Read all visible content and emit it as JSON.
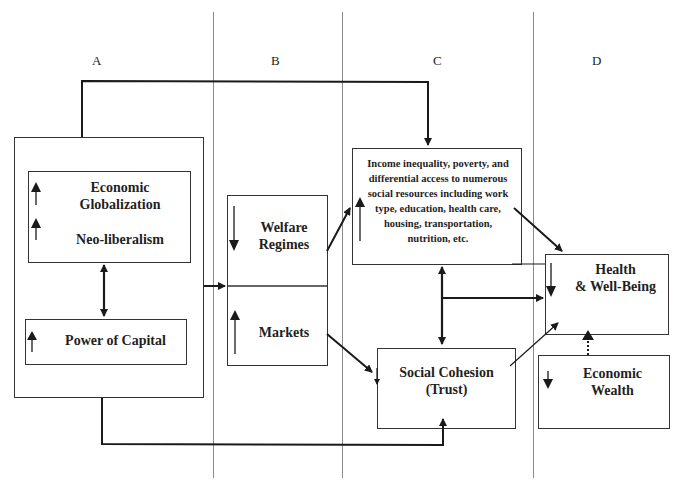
{
  "title_cropped": "",
  "columns": [
    {
      "id": "A",
      "label": "A"
    },
    {
      "id": "B",
      "label": "B"
    },
    {
      "id": "C",
      "label": "C"
    },
    {
      "id": "D",
      "label": "D"
    }
  ],
  "nodes": {
    "economic_globalization": {
      "label_line1": "Economic",
      "label_line2": "Globalization",
      "trend": "up"
    },
    "neo_liberalism": {
      "label": "Neo-liberalism",
      "trend": "up"
    },
    "power_of_capital": {
      "label": "Power of Capital",
      "trend": "up"
    },
    "welfare_regimes": {
      "label_line1": "Welfare",
      "label_line2": "Regimes",
      "trend": "down"
    },
    "markets": {
      "label": "Markets",
      "trend": "up"
    },
    "income_inequality": {
      "lines": [
        "Income inequality, poverty, and",
        "differential access to numerous",
        "social resources including work",
        "type, education, health care,",
        "housing, transportation,",
        "nutrition, etc."
      ],
      "trend": "up"
    },
    "social_cohesion": {
      "label_line1": "Social Cohesion",
      "label_line2": "(Trust)"
    },
    "health_well_being": {
      "label_line1": "Health",
      "label_line2": "& Well-Being",
      "trend": "down"
    },
    "economic_wealth": {
      "label_line1": "Economic",
      "label_line2": "Wealth",
      "trend": "down"
    }
  },
  "edges": [
    {
      "from": "column_A_box",
      "to": "income_inequality",
      "style": "solid",
      "route": "top"
    },
    {
      "from": "column_A_box",
      "to": "social_cohesion",
      "style": "solid",
      "route": "bottom"
    },
    {
      "from": "economic_globalization",
      "to": "power_of_capital",
      "style": "bidirectional"
    },
    {
      "from": "column_A_box",
      "to": "column_B_box",
      "style": "solid"
    },
    {
      "from": "welfare_regimes",
      "to": "income_inequality",
      "style": "solid"
    },
    {
      "from": "markets",
      "to": "social_cohesion",
      "style": "solid"
    },
    {
      "from": "income_inequality",
      "to": "social_cohesion",
      "style": "bidirectional"
    },
    {
      "from": "income_inequality",
      "to": "health_well_being",
      "style": "solid"
    },
    {
      "from": "income_social_link",
      "to": "health_well_being",
      "style": "solid"
    },
    {
      "from": "social_cohesion",
      "to": "health_well_being",
      "style": "thin"
    },
    {
      "from": "economic_wealth",
      "to": "health_well_being",
      "style": "dotted"
    }
  ],
  "colors": {
    "line": "#1a1a1a",
    "separator": "#8a8a8a",
    "box_border": "#333333"
  }
}
